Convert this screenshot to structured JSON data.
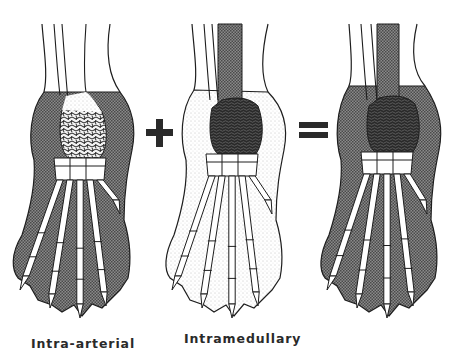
{
  "figure": {
    "panels": [
      {
        "id": "intra-arterial",
        "label": "Intra-arterial",
        "soft_tissue": "shaded",
        "bone_center": "light-mottled",
        "marrow_canal": "clear"
      },
      {
        "id": "intramedullary",
        "label": "Intramedullary",
        "soft_tissue": "clear",
        "bone_center": "dark-mottled",
        "marrow_canal": "shaded"
      },
      {
        "id": "combined",
        "label": "",
        "soft_tissue": "shaded",
        "bone_center": "dark-mottled",
        "marrow_canal": "shaded"
      }
    ],
    "operators": [
      "+",
      "="
    ],
    "colors": {
      "ink": "#1e1e1e",
      "shade": "#6e6e6e",
      "dark_shade": "#2e2e2e",
      "background": "#ffffff"
    }
  }
}
